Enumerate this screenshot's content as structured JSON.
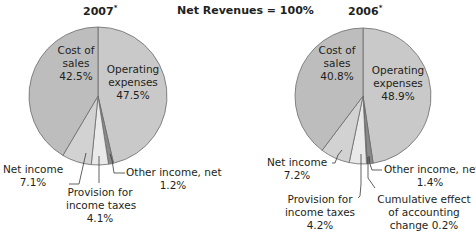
{
  "header": {
    "center_title": "Net Revenues = 100%",
    "left_title": "2007",
    "right_title": "2006",
    "title_marker": "*"
  },
  "chart_data": [
    {
      "type": "pie",
      "title": "2007*",
      "subtitle": "Net Revenues = 100%",
      "slices": [
        {
          "label": "Operating expenses",
          "value": 47.5
        },
        {
          "label": "Other income, net",
          "value": 1.2
        },
        {
          "label": "Provision for income taxes",
          "value": 4.1
        },
        {
          "label": "Net income",
          "value": 7.1
        },
        {
          "label": "Cost of sales",
          "value": 42.5
        }
      ],
      "order": "clockwise from 12 o'clock",
      "labels": {
        "cost_l1": "Cost of",
        "cost_l2": "sales",
        "cost_v": "42.5%",
        "op_l1": "Operating",
        "op_l2": "expenses",
        "op_v": "47.5%",
        "net_l1": "Net income",
        "net_v": "7.1%",
        "prov_l1": "Provision for",
        "prov_l2": "income taxes",
        "prov_v": "4.1%",
        "other_l1": "Other income, net",
        "other_v": "1.2%"
      }
    },
    {
      "type": "pie",
      "title": "2006*",
      "subtitle": "Net Revenues = 100%",
      "slices": [
        {
          "label": "Operating expenses",
          "value": 48.9
        },
        {
          "label": "Other income, net",
          "value": 1.4
        },
        {
          "label": "Cumulative effect of accounting change",
          "value": 0.2
        },
        {
          "label": "Provision for income taxes",
          "value": 4.2
        },
        {
          "label": "Net income",
          "value": 7.2
        },
        {
          "label": "Cost of sales",
          "value": 40.8
        }
      ],
      "order": "clockwise from 12 o'clock",
      "labels": {
        "cost_l1": "Cost of",
        "cost_l2": "sales",
        "cost_v": "40.8%",
        "op_l1": "Operating",
        "op_l2": "expenses",
        "op_v": "48.9%",
        "net_l1": "Net income",
        "net_v": "7.2%",
        "prov_l1": "Provision for",
        "prov_l2": "income taxes",
        "prov_v": "4.2%",
        "other_l1": "Other income, net",
        "other_v": "1.4%",
        "cum_l1": "Cumulative effect",
        "cum_l2": "of accounting",
        "cum_l3": "change 0.2%"
      }
    }
  ],
  "colors": {
    "Operating expenses": "#c9c9c9",
    "Other income, net": "#8a8a8a",
    "Cumulative effect of accounting change": "#5a5a5a",
    "Provision for income taxes": "#e9e9e9",
    "Net income": "#d2d2d2",
    "Cost of sales": "#bdbdbd",
    "outline": "#6b6b6b",
    "leader": "#3a3a3a"
  }
}
